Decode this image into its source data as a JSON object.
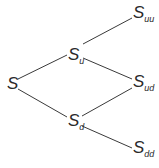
{
  "diagram": {
    "type": "binomial-tree",
    "colors": {
      "line": "#3a3a3a",
      "text": "#2a2a2a",
      "background": "#ffffff"
    },
    "nodes": [
      {
        "id": "S",
        "main": "S",
        "sub": "",
        "x": 7,
        "y": 75
      },
      {
        "id": "S_u",
        "main": "S",
        "sub": "u",
        "x": 68,
        "y": 48
      },
      {
        "id": "S_d",
        "main": "S",
        "sub": "d",
        "x": 68,
        "y": 113
      },
      {
        "id": "S_uu",
        "main": "S",
        "sub": "uu",
        "x": 133,
        "y": 5
      },
      {
        "id": "S_ud",
        "main": "S",
        "sub": "ud",
        "x": 133,
        "y": 74
      },
      {
        "id": "S_dd",
        "main": "S",
        "sub": "dd",
        "x": 133,
        "y": 141
      }
    ],
    "edges": [
      {
        "from": "S",
        "to": "S_u",
        "x1": 18,
        "y1": 79,
        "x2": 67,
        "y2": 55
      },
      {
        "from": "S",
        "to": "S_d",
        "x1": 18,
        "y1": 89,
        "x2": 67,
        "y2": 117
      },
      {
        "from": "S_u",
        "to": "S_uu",
        "x1": 83,
        "y1": 44,
        "x2": 132,
        "y2": 18
      },
      {
        "from": "S_u",
        "to": "S_ud",
        "x1": 83,
        "y1": 58,
        "x2": 132,
        "y2": 79
      },
      {
        "from": "S_d",
        "to": "S_ud",
        "x1": 82,
        "y1": 116,
        "x2": 132,
        "y2": 88
      },
      {
        "from": "S_d",
        "to": "S_dd",
        "x1": 82,
        "y1": 126,
        "x2": 132,
        "y2": 148
      }
    ]
  },
  "labels": {
    "S": {
      "main": "S",
      "sub": ""
    },
    "S_u": {
      "main": "S",
      "sub": "u"
    },
    "S_d": {
      "main": "S",
      "sub": "d"
    },
    "S_uu": {
      "main": "S",
      "sub": "uu"
    },
    "S_ud": {
      "main": "S",
      "sub": "ud"
    },
    "S_dd": {
      "main": "S",
      "sub": "dd"
    }
  }
}
